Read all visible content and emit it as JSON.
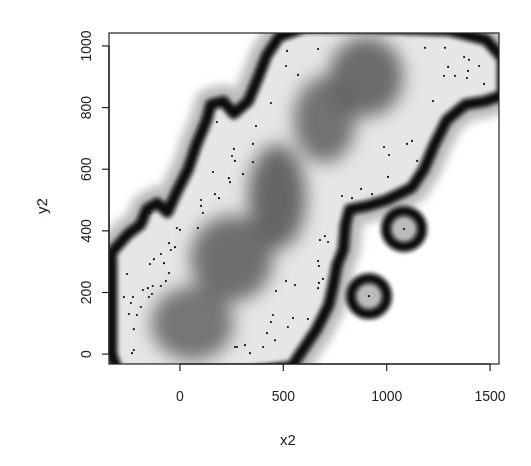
{
  "chart_data": {
    "type": "heatmap",
    "title": "",
    "xlabel": "x2",
    "ylabel": "y2",
    "xlim": [
      -343,
      1543
    ],
    "ylim": [
      -32,
      1042
    ],
    "xticks": [
      0,
      500,
      1000,
      1500
    ],
    "yticks": [
      0,
      200,
      400,
      600,
      800,
      1000
    ],
    "xtick_labels": [
      "0",
      "500",
      "1000",
      "1500"
    ],
    "ytick_labels": [
      "0",
      "200",
      "400",
      "600",
      "800",
      "1000"
    ],
    "grid": false,
    "legend": null,
    "colormap": "grayscale (white = outside domain, black = boundary band, dark gray = high-density core)",
    "points": {
      "x": [
        -53,
        -24,
        -44,
        -92,
        -126,
        -145,
        -77,
        -256,
        -53,
        -68,
        -92,
        -131,
        -155,
        -179,
        -135,
        -150,
        -227,
        -271,
        -237,
        -189,
        -247,
        -208,
        -223,
        -223,
        -232,
        -145,
        -15,
        0,
        87,
        102,
        102,
        111,
        169,
        189,
        160,
        237,
        242,
        305,
        353,
        266,
        252,
        261,
        353,
        368,
        440,
        571,
        513,
        518,
        668,
        1185,
        1282,
        1374,
        1398,
        1297,
        1447,
        1393,
        1277,
        1330,
        1388,
        1471,
        1224,
        987,
        1098,
        1122,
        1011,
        1147,
        1006,
        929,
        784,
        832,
        876,
        701,
        677,
        716,
        668,
        672,
        692,
        513,
        556,
        672,
        668,
        464,
        450,
        547,
        440,
        619,
        522,
        421,
        460,
        266,
        276,
        314,
        402,
        339,
        1084,
        914,
        179
      ],
      "y": [
        360,
        347,
        338,
        325,
        308,
        292,
        295,
        260,
        263,
        237,
        221,
        221,
        214,
        208,
        195,
        185,
        185,
        185,
        166,
        153,
        130,
        127,
        81,
        13,
        3,
        458,
        409,
        403,
        409,
        500,
        481,
        458,
        519,
        506,
        591,
        571,
        558,
        584,
        623,
        627,
        643,
        666,
        682,
        740,
        815,
        906,
        935,
        984,
        990,
        994,
        994,
        964,
        955,
        932,
        935,
        919,
        903,
        903,
        896,
        877,
        821,
        672,
        682,
        692,
        646,
        627,
        575,
        519,
        513,
        506,
        536,
        383,
        370,
        364,
        302,
        286,
        244,
        237,
        224,
        231,
        214,
        205,
        127,
        117,
        104,
        114,
        88,
        68,
        45,
        23,
        23,
        29,
        23,
        3,
        406,
        188,
        753
      ]
    },
    "isolated_points": [
      {
        "x": 1084,
        "y": 406
      },
      {
        "x": 914,
        "y": 188
      }
    ],
    "dense_cores": [
      {
        "x": 900,
        "y": 900,
        "rx": 180,
        "ry": 130
      },
      {
        "x": 700,
        "y": 760,
        "rx": 150,
        "ry": 140
      },
      {
        "x": 470,
        "y": 510,
        "rx": 140,
        "ry": 170
      },
      {
        "x": 250,
        "y": 310,
        "rx": 200,
        "ry": 140
      },
      {
        "x": 60,
        "y": 100,
        "rx": 200,
        "ry": 120
      }
    ],
    "colors": {
      "background": "#ffffff",
      "boundary": "#0a0a0a",
      "domain_light": "#e4e4e4",
      "core_dark": "#5a5a5a",
      "points": "#111111",
      "axis": "#222222"
    }
  }
}
